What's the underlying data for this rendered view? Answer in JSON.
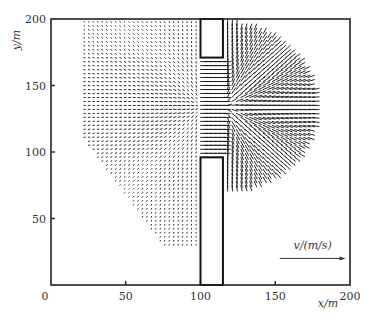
{
  "chart_data": {
    "type": "quiver",
    "title": "",
    "xlabel": "x/m",
    "ylabel": "y/m",
    "xlim": [
      0,
      200
    ],
    "ylim": [
      0,
      200
    ],
    "xticks": [
      0,
      50,
      100,
      150,
      200
    ],
    "yticks": [
      50,
      100,
      150,
      200
    ],
    "xtick_labels": [
      "0",
      "50",
      "100",
      "150",
      "200"
    ],
    "ytick_labels": [
      "50",
      "100",
      "150",
      "200"
    ],
    "grid": false,
    "legend": {
      "label": "v/(m/s)",
      "position": "lower right",
      "arrow_from_x": 153,
      "arrow_to_x": 197,
      "arrow_y": 20
    },
    "geometry": {
      "wall_left_x": 100,
      "wall_right_x": 115,
      "upper_block_bottom_y": 171,
      "lower_block_top_y": 96,
      "opening_center_y": 134
    },
    "field": {
      "x_range": [
        22,
        175
      ],
      "y_range": [
        30,
        200
      ],
      "grid_spacing_m": 3,
      "description": "Velocity vectors converge toward opening between breakwater blocks (x 100-115, y 96-171), strongest along centerline y~135, then spread radially into semicircle (radius ~60m) on downstream side"
    },
    "colors": {
      "arrows": "#111111",
      "frame": "#222222",
      "background": "#ffffff"
    }
  }
}
